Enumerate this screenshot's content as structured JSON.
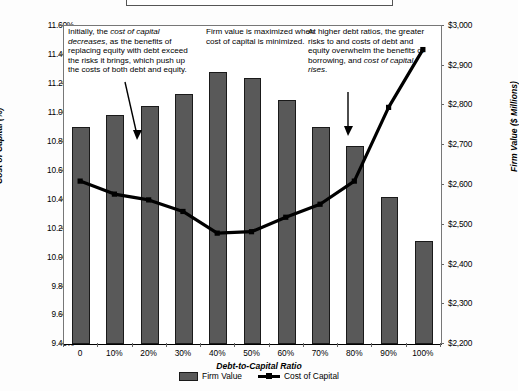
{
  "chart_data": {
    "type": "bar",
    "title": "",
    "xlabel": "Debt-to-Capital Ratio",
    "categories": [
      "0",
      "10%",
      "20%",
      "30%",
      "40%",
      "50%",
      "60%",
      "70%",
      "80%",
      "90%",
      "100%"
    ],
    "grid": false,
    "legend_position": "bottom",
    "series": [
      {
        "name": "Firm Value",
        "type": "bar",
        "axis": "right",
        "unit": "$ Millions",
        "values": [
          2745,
          2777,
          2798,
          2830,
          2885,
          2870,
          2813,
          2745,
          2698,
          2570,
          2460
        ]
      },
      {
        "name": "Cost of Capital",
        "type": "line",
        "axis": "left",
        "unit": "%",
        "values": [
          10.52,
          10.43,
          10.39,
          10.31,
          10.16,
          10.17,
          10.27,
          10.36,
          10.52,
          11.03,
          11.43
        ]
      }
    ],
    "left_axis": {
      "label": "Cost of Capital (%)",
      "min": 9.4,
      "max": 11.6,
      "step": 0.2,
      "ticks": [
        "9.40%",
        "9.60%",
        "9.80%",
        "10.00%",
        "10.20%",
        "10.40%",
        "10.60%",
        "10.80%",
        "11.00%",
        "11.20%",
        "11.40%",
        "11.60%"
      ]
    },
    "right_axis": {
      "label": "Firm Value ($ Millions)",
      "min": 2200,
      "max": 3000,
      "step": 100,
      "ticks": [
        "$2,200",
        "$2,300",
        "$2,400",
        "$2,500",
        "$2,600",
        "$2,700",
        "$2,800",
        "$2,900",
        "$3,000"
      ]
    },
    "annotations": [
      {
        "id": "annotation-initial-decrease",
        "text": "Initially, the cost of capital decreases, as the benefits of replacing equity with debt exceed the risks it brings, which push up the costs of both debt and equity.",
        "target": "cost-of-capital-line-at-20-percent"
      },
      {
        "id": "annotation-firm-value-maximized",
        "text": "Firm value is maximized when cost of capital is minimized.",
        "target": "firm-value-bar-at-40-percent"
      },
      {
        "id": "annotation-higher-debt-ratios",
        "text": "At higher debt ratios, the greater risks to and costs of debt and equity overwhelm the benefits of borrowing, and cost of capital rises.",
        "target": "cost-of-capital-line-at-80-percent"
      }
    ]
  },
  "legend": {
    "items": [
      {
        "label": "Firm Value",
        "marker": "bar-swatch",
        "color": "#595959"
      },
      {
        "label": "Cost of Capital",
        "marker": "line-swatch",
        "color": "#000000"
      }
    ]
  },
  "annotations_rich": {
    "a1": {
      "p1": "Initially, the ",
      "em1": "cost of capital",
      "p2": " ",
      "em2": "decreases",
      "p3": ", as the benefits of replacing equity with debt exceed the risks it brings, which push up the costs of both debt and equity."
    },
    "a2": {
      "p1": "Firm value is maximized when cost of capital is minimized."
    },
    "a3": {
      "p1": "At higher debt ratios, the greater risks to and costs of debt and equity overwhelm the benefits of borrowing, and ",
      "em1": "cost of capital rises",
      "p2": "."
    }
  },
  "colors": {
    "bar_fill": "#595959",
    "bar_stroke": "#1a1a1a",
    "line": "#000000",
    "axis": "#666666",
    "background": "#ffffff"
  }
}
